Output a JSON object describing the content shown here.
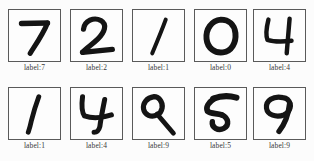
{
  "figure": {
    "title": "",
    "label_prefix": "label:",
    "rows": 2,
    "columns": 5,
    "background_color": "#fcfcfc",
    "border_color": "#5a5a5a",
    "ink_color": "#141414",
    "label_color": "#3a3a3a"
  },
  "samples": [
    {
      "index": 0,
      "row": 0,
      "col": 0,
      "digit": "7",
      "label_text": "label:7"
    },
    {
      "index": 1,
      "row": 0,
      "col": 1,
      "digit": "2",
      "label_text": "label:2"
    },
    {
      "index": 2,
      "row": 0,
      "col": 2,
      "digit": "1",
      "label_text": "label:1"
    },
    {
      "index": 3,
      "row": 0,
      "col": 3,
      "digit": "0",
      "label_text": "label:0"
    },
    {
      "index": 4,
      "row": 0,
      "col": 4,
      "digit": "4",
      "label_text": "label:4"
    },
    {
      "index": 5,
      "row": 1,
      "col": 0,
      "digit": "1",
      "label_text": "label:1"
    },
    {
      "index": 6,
      "row": 1,
      "col": 1,
      "digit": "4",
      "label_text": "label:4"
    },
    {
      "index": 7,
      "row": 1,
      "col": 2,
      "digit": "9",
      "label_text": "label:9"
    },
    {
      "index": 8,
      "row": 1,
      "col": 3,
      "digit": "5",
      "label_text": "label:5"
    },
    {
      "index": 9,
      "row": 1,
      "col": 4,
      "digit": "9",
      "label_text": "label:9"
    }
  ]
}
